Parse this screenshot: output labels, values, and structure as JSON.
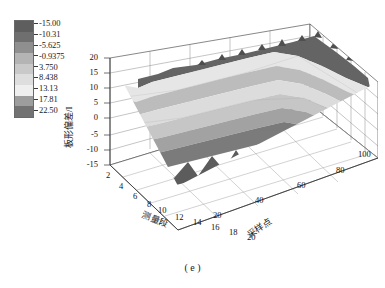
{
  "figure": {
    "caption": "( e )",
    "background": "#ffffff"
  },
  "colorbar": {
    "name": "flatness-deviation-colorbar",
    "orientation": "vertical",
    "tick_labels": [
      "-15.00",
      "-10.31",
      "-5.625",
      "-0.9375",
      "3.750",
      "8.438",
      "13.13",
      "17.81",
      "22.50"
    ],
    "band_colors": [
      "#5e5e5e",
      "#6f6f6f",
      "#8f8f8f",
      "#b4b4b4",
      "#c9c9c9",
      "#dedede",
      "#efefef",
      "#9d9d9d",
      "#727272",
      "#565656"
    ],
    "band_count": 9
  },
  "axes": {
    "z": {
      "label": "板形偏差/I",
      "ticks": [
        "20",
        "15",
        "10",
        "5",
        "0",
        "-5",
        "-10",
        "-15"
      ],
      "min": -15,
      "max": 20
    },
    "x": {
      "label": "测量段",
      "ticks": [
        "2",
        "4",
        "6",
        "8",
        "10",
        "12",
        "14",
        "16",
        "18",
        "20"
      ],
      "min": 2,
      "max": 20
    },
    "y": {
      "label": "采样点",
      "ticks": [
        "20",
        "40",
        "60",
        "80",
        "100"
      ],
      "min": 0,
      "max": 100
    }
  },
  "chart_data": {
    "type": "surface",
    "title": "",
    "xlabel": "测量段",
    "ylabel": "采样点",
    "zlabel": "板形偏差/I",
    "xlim": [
      2,
      20
    ],
    "ylim": [
      0,
      100
    ],
    "zlim": [
      -15,
      20
    ],
    "grid": true,
    "legend": "colorbar-right-of-axes",
    "colormap": "gray-discrete-9",
    "colorbar_levels": [
      -15.0,
      -10.31,
      -5.625,
      -0.9375,
      3.75,
      8.438,
      13.13,
      17.81,
      22.5
    ],
    "series": [
      {
        "name": "segment-band-1",
        "z_level": 14.5,
        "color": "#6f6f6f"
      },
      {
        "name": "segment-band-2",
        "z_level": 11.0,
        "color": "#c9c9c9"
      },
      {
        "name": "segment-band-3",
        "z_level": 7.0,
        "color": "#b4b4b4"
      },
      {
        "name": "segment-band-4",
        "z_level": 3.0,
        "color": "#dedede"
      },
      {
        "name": "segment-band-5",
        "z_level": -1.0,
        "color": "#c0c0c0"
      },
      {
        "name": "segment-band-6",
        "z_level": -5.0,
        "color": "#9d9d9d"
      },
      {
        "name": "segment-band-7",
        "z_level": -9.0,
        "color": "#8f8f8f"
      },
      {
        "name": "segment-band-8",
        "z_level": -12.5,
        "color": "#6a6a6a"
      }
    ]
  }
}
